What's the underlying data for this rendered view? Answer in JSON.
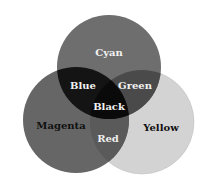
{
  "diagram": {
    "type": "venn",
    "circles": [
      {
        "label": "Cyan",
        "cx": 109,
        "cy": 67,
        "r": 52,
        "fill": "#6b6b6b"
      },
      {
        "label": "Magenta",
        "cx": 76,
        "cy": 120,
        "r": 53,
        "fill": "#646464"
      },
      {
        "label": "Yellow",
        "cx": 142,
        "cy": 122,
        "r": 52,
        "fill": "#d2d2d2"
      }
    ],
    "labels": {
      "cyan": "Cyan",
      "magenta": "Magenta",
      "yellow": "Yellow",
      "blue": "Blue",
      "green": "Green",
      "red": "Red",
      "black": "Black"
    }
  }
}
